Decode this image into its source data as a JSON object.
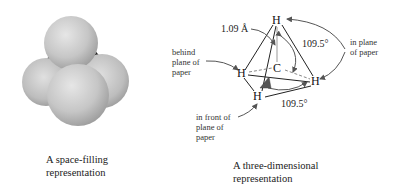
{
  "space_filling": {
    "caption_line1": "A space-filling",
    "caption_line2": "representation",
    "atoms": [
      {
        "element": "H",
        "position": "top",
        "color": "#c8c8c8"
      },
      {
        "element": "H",
        "position": "left",
        "color": "#bdbdbd"
      },
      {
        "element": "H",
        "position": "right",
        "color": "#c4c4c4"
      },
      {
        "element": "H",
        "position": "front",
        "color": "#cfcfcf"
      },
      {
        "element": "C",
        "position": "center-behind",
        "color": "#2a2a2a"
      }
    ]
  },
  "three_d": {
    "caption_line1": "A three-dimensional",
    "caption_line2": "representation",
    "atoms": {
      "top": "H",
      "center": "C",
      "left": "H",
      "right": "H",
      "bottom": "H"
    },
    "bond_length": "1.09 Å",
    "angle_upper": "109.5°",
    "angle_lower": "109.5°",
    "annotations": {
      "behind": [
        "behind",
        "plane of",
        "paper"
      ],
      "in_plane": [
        "in plane",
        "of paper"
      ],
      "in_front": [
        "in front of",
        "plane of",
        "paper"
      ]
    }
  }
}
